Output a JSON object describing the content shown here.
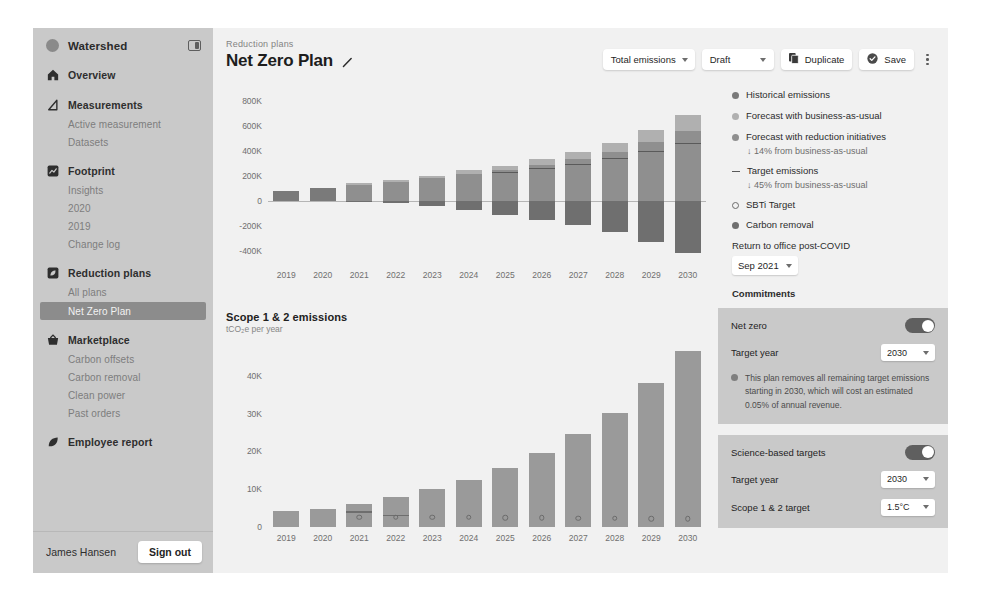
{
  "sidebar": {
    "brand": "Watershed",
    "collapse_icon": "panel-collapse-icon",
    "groups": [
      {
        "label": "Overview",
        "icon": "home-icon",
        "items": []
      },
      {
        "label": "Measurements",
        "icon": "triangle-icon",
        "items": [
          {
            "label": "Active measurement",
            "active": false
          },
          {
            "label": "Datasets",
            "active": false
          }
        ]
      },
      {
        "label": "Footprint",
        "icon": "chart-square-icon",
        "items": [
          {
            "label": "Insights",
            "active": false
          },
          {
            "label": "2020",
            "active": false
          },
          {
            "label": "2019",
            "active": false
          },
          {
            "label": "Change log",
            "active": false
          }
        ]
      },
      {
        "label": "Reduction plans",
        "icon": "leaf-square-icon",
        "items": [
          {
            "label": "All plans",
            "active": false
          },
          {
            "label": "Net Zero Plan",
            "active": true
          }
        ]
      },
      {
        "label": "Marketplace",
        "icon": "basket-icon",
        "items": [
          {
            "label": "Carbon offsets",
            "active": false
          },
          {
            "label": "Carbon removal",
            "active": false
          },
          {
            "label": "Clean power",
            "active": false
          },
          {
            "label": "Past orders",
            "active": false
          }
        ]
      },
      {
        "label": "Employee report",
        "icon": "leaf-icon",
        "items": []
      }
    ],
    "user_name": "James Hansen",
    "sign_out": "Sign out"
  },
  "header": {
    "breadcrumb": "Reduction plans",
    "title": "Net Zero Plan",
    "edit_icon": "pencil-icon",
    "view_select": "Total emissions",
    "status_select": "Draft",
    "duplicate_label": "Duplicate",
    "duplicate_icon": "copy-icon",
    "save_label": "Save",
    "save_icon": "check-circle-icon",
    "more_icon": "kebab-menu-icon"
  },
  "legend": {
    "items": [
      {
        "marker": "dot",
        "color": "#7a7a7a",
        "label": "Historical emissions",
        "sub": null
      },
      {
        "marker": "dot",
        "color": "#b0b0b0",
        "label": "Forecast with business-as-usual",
        "sub": null
      },
      {
        "marker": "dot",
        "color": "#8f8f8f",
        "label": "Forecast with reduction initiatives",
        "sub": "↓ 14% from business-as-usual"
      },
      {
        "marker": "dash",
        "color": "#5a5a5a",
        "label": "Target emissions",
        "sub": "↓ 45% from business-as-usual"
      },
      {
        "marker": "ring",
        "color": "#6b6b6b",
        "label": "SBTi Target",
        "sub": null
      },
      {
        "marker": "dot",
        "color": "#6f6f6f",
        "label": "Carbon removal",
        "sub": null
      }
    ],
    "return_label": "Return to office post-COVID",
    "return_value": "Sep 2021",
    "commitments_heading": "Commitments"
  },
  "commitments": [
    {
      "name": "Net zero",
      "toggle_on": true,
      "rows": [
        {
          "label": "Target year",
          "value": "2030"
        }
      ],
      "note": "This plan removes all remaining target emissions starting in 2030, which will cost an estimated 0.05% of annual revenue."
    },
    {
      "name": "Science-based targets",
      "toggle_on": true,
      "rows": [
        {
          "label": "Target year",
          "value": "2030"
        },
        {
          "label": "Scope 1 & 2 target",
          "value": "1.5°C"
        }
      ],
      "note": null
    }
  ],
  "chart_data": [
    {
      "id": "total-emissions",
      "type": "bar",
      "stacked": true,
      "title": "",
      "subtitle": "",
      "xlabel": "",
      "ylabel": "",
      "categories": [
        "2019",
        "2020",
        "2021",
        "2022",
        "2023",
        "2024",
        "2025",
        "2026",
        "2027",
        "2028",
        "2029",
        "2030"
      ],
      "ytick_labels": [
        "800K",
        "600K",
        "400K",
        "200K",
        "0",
        "-200K",
        "-400K"
      ],
      "ytick_values": [
        800000,
        600000,
        400000,
        200000,
        0,
        -200000,
        -400000
      ],
      "ylim": [
        -500000,
        900000
      ],
      "grid": false,
      "legend_position": "right",
      "series": [
        {
          "name": "Historical emissions",
          "color": "#7a7a7a",
          "values": [
            78000,
            103000,
            null,
            null,
            null,
            null,
            null,
            null,
            null,
            null,
            null,
            null
          ]
        },
        {
          "name": "Forecast with reduction initiatives",
          "color": "#8f8f8f",
          "values": [
            null,
            null,
            125000,
            152000,
            178000,
            214000,
            246000,
            286000,
            330000,
            392000,
            470000,
            560000
          ]
        },
        {
          "name": "Forecast with business-as-usual",
          "color": "#b0b0b0",
          "values": [
            null,
            null,
            12000,
            16000,
            22000,
            28000,
            34000,
            46000,
            58000,
            72000,
            96000,
            128000
          ]
        },
        {
          "name": "Carbon removal",
          "color": "#6f6f6f",
          "values": [
            0,
            0,
            -4000,
            -22000,
            -46000,
            -78000,
            -112000,
            -152000,
            -198000,
            -252000,
            -330000,
            -420000
          ]
        }
      ],
      "target_line": {
        "name": "Target emissions",
        "color": "#5a5a5a",
        "values": [
          null,
          null,
          null,
          null,
          null,
          null,
          230000,
          262000,
          296000,
          340000,
          400000,
          460000
        ]
      }
    },
    {
      "id": "scope-1-2-emissions",
      "type": "bar",
      "stacked": false,
      "title": "Scope 1 & 2 emissions",
      "subtitle": "tCO₂e per year",
      "xlabel": "",
      "ylabel": "",
      "categories": [
        "2019",
        "2020",
        "2021",
        "2022",
        "2023",
        "2024",
        "2025",
        "2026",
        "2027",
        "2028",
        "2029",
        "2030"
      ],
      "ytick_labels": [
        "40K",
        "30K",
        "20K",
        "10K",
        "0"
      ],
      "ytick_values": [
        40000,
        30000,
        20000,
        10000,
        0
      ],
      "ylim": [
        0,
        45000
      ],
      "grid": false,
      "series": [
        {
          "name": "Emissions",
          "color": "#9a9a9a",
          "values": [
            4200,
            4800,
            6200,
            8000,
            10000,
            12500,
            15500,
            19600,
            24500,
            30200,
            38000,
            46500
          ]
        }
      ],
      "target_line": {
        "name": "Target emissions",
        "color": "#6e6e6e",
        "values": [
          null,
          null,
          4200,
          3300,
          null,
          null,
          null,
          null,
          null,
          null,
          null,
          null
        ]
      },
      "sbti_markers": {
        "name": "SBTi Target",
        "color": "#6b6b6b",
        "values": [
          null,
          null,
          4100,
          4100,
          4000,
          4000,
          3900,
          3900,
          3800,
          3800,
          3700,
          3700
        ]
      }
    }
  ]
}
